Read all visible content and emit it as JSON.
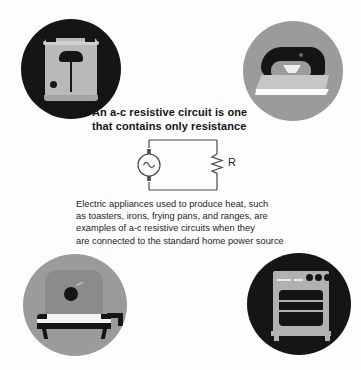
{
  "page": {
    "background_color": "#fdfdfd",
    "width": 361,
    "height": 370
  },
  "headline": {
    "line1": "An a-c resistive circuit is one",
    "line2": "that contains only resistance"
  },
  "caption": {
    "line1": "Electric appliances used to produce heat, such",
    "line2": "as toasters, irons, frying pans, and ranges, are",
    "line3": "examples of a-c resistive circuits when they",
    "line4": "are connected to the standard home power source"
  },
  "circuit": {
    "source_name": "ac-voltage-source",
    "resistor_label": "R",
    "line_color": "#4a4a4a"
  },
  "badges": [
    {
      "id": "toaster",
      "name": "toaster",
      "circle_color": "#151515",
      "appliance_color": "#b9b9b9"
    },
    {
      "id": "iron",
      "name": "clothes-iron",
      "circle_color": "#9b9b9b",
      "appliance_color": "#151515"
    },
    {
      "id": "pan",
      "name": "electric-frying-pan",
      "circle_color": "#9b9b9b",
      "appliance_color": "#151515"
    },
    {
      "id": "range",
      "name": "kitchen-range",
      "circle_color": "#151515",
      "appliance_color": "#b1b1b1"
    }
  ]
}
